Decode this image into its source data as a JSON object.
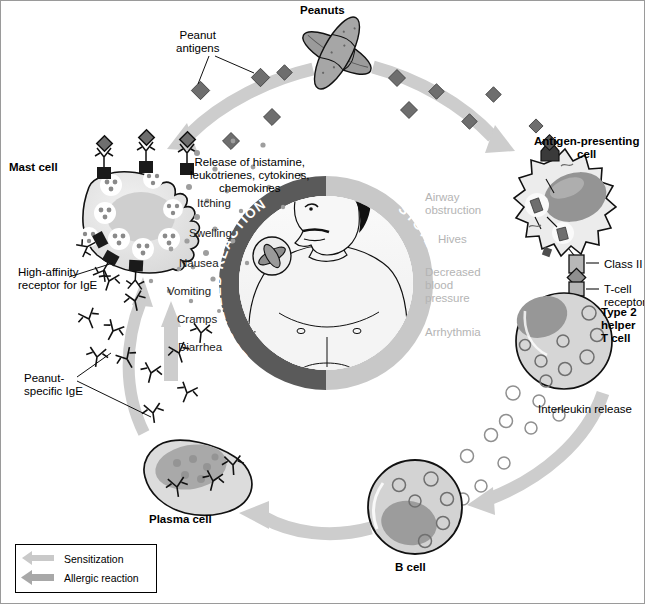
{
  "diagram": {
    "top_label": "Peanuts",
    "antigens_label": "Peanut\nantigens",
    "mast_cell_label": "Mast cell",
    "receptor_label": "High-affinity\nreceptor for IgE",
    "ige_label": "Peanut-\nspecific IgE",
    "apc_label": "Antigen-presenting\ncell",
    "class2_label": "Class II",
    "tcr_label": "T-cell\nreceptor",
    "th2_label": "Type 2\nhelper\nT cell",
    "interleukin_label": "Interleukin release",
    "bcell_label": "B cell",
    "plasma_label": "Plasma cell",
    "release_label": "Release of histamine,\nleukotrienes, cytokines,\nchemokines",
    "arc_localized": "LOCALIZED REACTIONS",
    "arc_systemic": "SYSTEMIC REACTIONS"
  },
  "localized_symptoms": [
    {
      "text": "Itching",
      "x": 196,
      "y": 196
    },
    {
      "text": "Swelling",
      "x": 188,
      "y": 226
    },
    {
      "text": "Nausea",
      "x": 178,
      "y": 256
    },
    {
      "text": "Vomiting",
      "x": 166,
      "y": 284
    },
    {
      "text": "Cramps",
      "x": 176,
      "y": 312
    },
    {
      "text": "Diarrhea",
      "x": 177,
      "y": 340
    }
  ],
  "systemic_symptoms": [
    {
      "text": "Airway\nobstruction",
      "x": 424,
      "y": 190
    },
    {
      "text": "Hives",
      "x": 437,
      "y": 232
    },
    {
      "text": "Decreased\nblood\npressure",
      "x": 424,
      "y": 265
    },
    {
      "text": "Arrhythmia",
      "x": 424,
      "y": 325
    }
  ],
  "legend": {
    "items": [
      {
        "label": "Sensitization",
        "color": "#c9c9c9"
      },
      {
        "label": "Allergic reaction",
        "color": "#a8a8a8"
      }
    ]
  },
  "colors": {
    "arc_localized_fill": "#5a5a5a",
    "arc_systemic_fill": "#c8c8c8",
    "arrow_light": "#cdcdcd",
    "arrow_mid": "#b0b0b0",
    "cell_fill": "#e2e2e2",
    "nucleus_fill": "#9a9a9a",
    "antigen_fill": "#6e6e6e",
    "outline": "#000000",
    "systemic_text": "#b4b4b4"
  }
}
